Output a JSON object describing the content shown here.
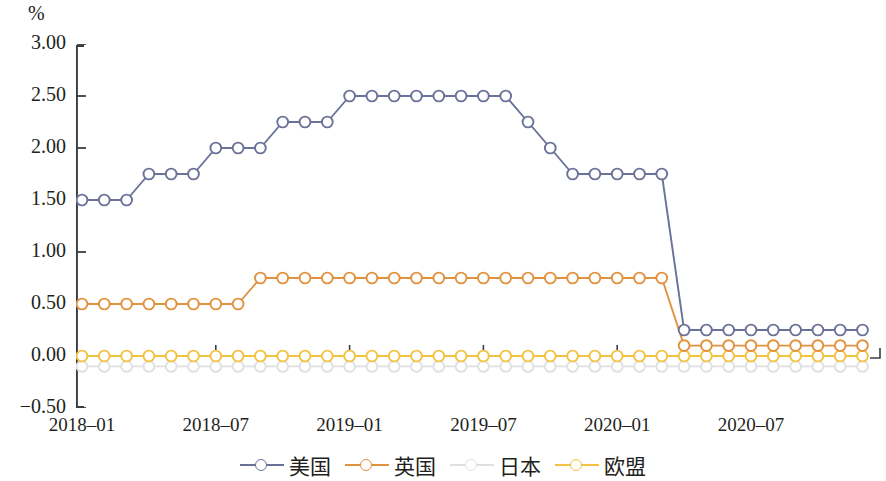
{
  "chart_data": {
    "type": "line",
    "title": "",
    "unit_label": "%",
    "xlabel": "",
    "ylabel": "",
    "ylim": [
      -0.5,
      3.0
    ],
    "yticks": [
      "3.00",
      "2.50",
      "2.00",
      "1.50",
      "1.00",
      "0.50",
      "0.00",
      "-0.50"
    ],
    "ytick_values": [
      3.0,
      2.5,
      2.0,
      1.5,
      1.0,
      0.5,
      0.0,
      -0.5
    ],
    "xticks": [
      "2018-01",
      "2018-07",
      "2019-01",
      "2019-07",
      "2020-01",
      "2020-07"
    ],
    "xtick_indices": [
      0,
      6,
      12,
      18,
      24,
      30
    ],
    "grid": false,
    "legend_position": "bottom",
    "x": [
      "2018-01",
      "2018-02",
      "2018-03",
      "2018-04",
      "2018-05",
      "2018-06",
      "2018-07",
      "2018-08",
      "2018-09",
      "2018-10",
      "2018-11",
      "2018-12",
      "2019-01",
      "2019-02",
      "2019-03",
      "2019-04",
      "2019-05",
      "2019-06",
      "2019-07",
      "2019-08",
      "2019-09",
      "2019-10",
      "2019-11",
      "2019-12",
      "2020-01",
      "2020-02",
      "2020-03",
      "2020-04",
      "2020-05",
      "2020-06",
      "2020-07",
      "2020-08",
      "2020-09",
      "2020-10",
      "2020-11",
      "2020-12"
    ],
    "series": [
      {
        "name": "美国",
        "color": "#6b7299",
        "values": [
          1.5,
          1.5,
          1.5,
          1.75,
          1.75,
          1.75,
          2.0,
          2.0,
          2.0,
          2.25,
          2.25,
          2.25,
          2.5,
          2.5,
          2.5,
          2.5,
          2.5,
          2.5,
          2.5,
          2.5,
          2.25,
          2.0,
          1.75,
          1.75,
          1.75,
          1.75,
          1.75,
          0.25,
          0.25,
          0.25,
          0.25,
          0.25,
          0.25,
          0.25,
          0.25,
          0.25
        ]
      },
      {
        "name": "英国",
        "color": "#e2923f",
        "values": [
          0.5,
          0.5,
          0.5,
          0.5,
          0.5,
          0.5,
          0.5,
          0.5,
          0.75,
          0.75,
          0.75,
          0.75,
          0.75,
          0.75,
          0.75,
          0.75,
          0.75,
          0.75,
          0.75,
          0.75,
          0.75,
          0.75,
          0.75,
          0.75,
          0.75,
          0.75,
          0.75,
          0.1,
          0.1,
          0.1,
          0.1,
          0.1,
          0.1,
          0.1,
          0.1,
          0.1
        ]
      },
      {
        "name": "日本",
        "color": "#dfe0e2",
        "values": [
          -0.1,
          -0.1,
          -0.1,
          -0.1,
          -0.1,
          -0.1,
          -0.1,
          -0.1,
          -0.1,
          -0.1,
          -0.1,
          -0.1,
          -0.1,
          -0.1,
          -0.1,
          -0.1,
          -0.1,
          -0.1,
          -0.1,
          -0.1,
          -0.1,
          -0.1,
          -0.1,
          -0.1,
          -0.1,
          -0.1,
          -0.1,
          -0.1,
          -0.1,
          -0.1,
          -0.1,
          -0.1,
          -0.1,
          -0.1,
          -0.1,
          -0.1
        ]
      },
      {
        "name": "欧盟",
        "color": "#f2c341",
        "values": [
          0.0,
          0.0,
          0.0,
          0.0,
          0.0,
          0.0,
          0.0,
          0.0,
          0.0,
          0.0,
          0.0,
          0.0,
          0.0,
          0.0,
          0.0,
          0.0,
          0.0,
          0.0,
          0.0,
          0.0,
          0.0,
          0.0,
          0.0,
          0.0,
          0.0,
          0.0,
          0.0,
          0.0,
          0.0,
          0.0,
          0.0,
          0.0,
          0.0,
          0.0,
          0.0,
          0.0
        ]
      }
    ]
  },
  "legend": {
    "items": [
      {
        "label": "美国",
        "color": "#6b7299"
      },
      {
        "label": "英国",
        "color": "#e2923f"
      },
      {
        "label": "日本",
        "color": "#dfe0e2"
      },
      {
        "label": "欧盟",
        "color": "#f2c341"
      }
    ]
  }
}
